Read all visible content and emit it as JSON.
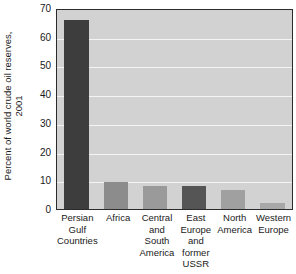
{
  "chart_data": {
    "type": "bar",
    "title": "",
    "xlabel": "",
    "ylabel": "Percent of world crude oil reserves, 2001",
    "ylabel_lines": [
      "Percent of world crude oil reserves,",
      "2001"
    ],
    "categories": [
      "Persian Gulf Countries",
      "Africa",
      "Central and South America",
      "East Europe and former USSR",
      "North America",
      "Western Europe"
    ],
    "category_lines": [
      [
        "Persian",
        "Gulf",
        "Countries"
      ],
      [
        "Africa"
      ],
      [
        "Central",
        "and",
        "South",
        "America"
      ],
      [
        "East",
        "Europe",
        "and",
        "former",
        "USSR"
      ],
      [
        "North",
        "America"
      ],
      [
        "Western",
        "Europe"
      ]
    ],
    "values": [
      66,
      9.4,
      8,
      8,
      6.6,
      2
    ],
    "bar_colors": [
      "#3d3d3d",
      "#8c8c8c",
      "#9a9a9a",
      "#555555",
      "#a0a0a0",
      "#a8a8a8"
    ],
    "ylim": [
      0,
      70
    ],
    "yticks": [
      0,
      10,
      20,
      30,
      40,
      50,
      60,
      70
    ],
    "ytick_labels": [
      "0",
      "10",
      "20",
      "30",
      "40",
      "50",
      "60",
      "70"
    ],
    "grid": true,
    "grid_color": "#f4f4f4",
    "plot_background": "#d2d2d2",
    "legend": null
  }
}
